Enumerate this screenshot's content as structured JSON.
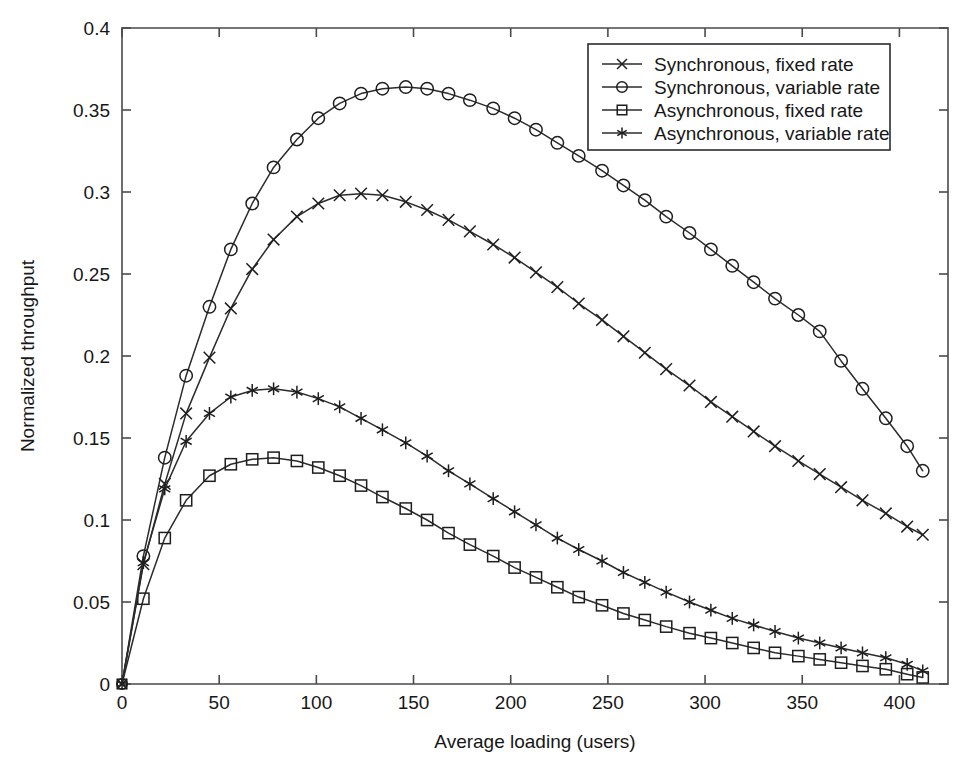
{
  "chart_data": {
    "type": "line",
    "title": "",
    "xlabel": "Average loading (users)",
    "ylabel": "Normalized throughput",
    "xlim": [
      0,
      425
    ],
    "ylim": [
      0,
      0.4
    ],
    "xticks": [
      0,
      50,
      100,
      150,
      200,
      250,
      300,
      350,
      400
    ],
    "xtick_labels": [
      "0",
      "50",
      "100",
      "150",
      "200",
      "250",
      "300",
      "350",
      "400"
    ],
    "yticks": [
      0,
      0.05,
      0.1,
      0.15,
      0.2,
      0.25,
      0.3,
      0.35,
      0.4
    ],
    "ytick_labels": [
      "0",
      "0.05",
      "0.1",
      "0.15",
      "0.2",
      "0.25",
      "0.3",
      "0.35",
      "0.4"
    ],
    "grid": false,
    "legend_position": "top-right",
    "line_color": "#2b2b2b",
    "background_color": "#ffffff",
    "series": [
      {
        "name": "Synchronous, fixed rate",
        "marker": "x",
        "x": [
          0,
          11,
          22,
          33,
          45,
          56,
          67,
          78,
          90,
          101,
          112,
          123,
          134,
          146,
          157,
          168,
          179,
          191,
          202,
          213,
          224,
          235,
          247,
          258,
          269,
          280,
          292,
          303,
          314,
          325,
          336,
          348,
          359,
          370,
          381,
          393,
          404,
          412
        ],
        "values": [
          0.0,
          0.073,
          0.122,
          0.165,
          0.199,
          0.229,
          0.253,
          0.271,
          0.285,
          0.293,
          0.298,
          0.299,
          0.298,
          0.294,
          0.289,
          0.283,
          0.276,
          0.268,
          0.26,
          0.251,
          0.242,
          0.232,
          0.222,
          0.212,
          0.202,
          0.192,
          0.182,
          0.172,
          0.163,
          0.154,
          0.145,
          0.136,
          0.128,
          0.12,
          0.112,
          0.104,
          0.096,
          0.091
        ]
      },
      {
        "name": "Synchronous, variable rate",
        "marker": "o",
        "x": [
          0,
          11,
          22,
          33,
          45,
          56,
          67,
          78,
          90,
          101,
          112,
          123,
          134,
          146,
          157,
          168,
          179,
          191,
          202,
          213,
          224,
          235,
          247,
          258,
          269,
          280,
          292,
          303,
          314,
          325,
          336,
          348,
          359,
          370,
          381,
          393,
          404,
          412
        ],
        "values": [
          0.0,
          0.078,
          0.138,
          0.188,
          0.23,
          0.265,
          0.293,
          0.315,
          0.332,
          0.345,
          0.354,
          0.36,
          0.363,
          0.364,
          0.363,
          0.36,
          0.356,
          0.351,
          0.345,
          0.338,
          0.33,
          0.322,
          0.313,
          0.304,
          0.295,
          0.285,
          0.275,
          0.265,
          0.255,
          0.245,
          0.235,
          0.225,
          0.215,
          0.197,
          0.18,
          0.162,
          0.145,
          0.13
        ]
      },
      {
        "name": "Asynchronous, fixed rate",
        "marker": "s",
        "x": [
          0,
          11,
          22,
          33,
          45,
          56,
          67,
          78,
          90,
          101,
          112,
          123,
          134,
          146,
          157,
          168,
          179,
          191,
          202,
          213,
          224,
          235,
          247,
          258,
          269,
          280,
          292,
          303,
          314,
          325,
          336,
          348,
          359,
          370,
          381,
          393,
          404,
          412
        ],
        "values": [
          0.0,
          0.052,
          0.089,
          0.112,
          0.127,
          0.134,
          0.137,
          0.138,
          0.136,
          0.132,
          0.127,
          0.121,
          0.114,
          0.107,
          0.1,
          0.092,
          0.085,
          0.078,
          0.071,
          0.065,
          0.059,
          0.053,
          0.048,
          0.043,
          0.039,
          0.035,
          0.031,
          0.028,
          0.025,
          0.022,
          0.019,
          0.017,
          0.015,
          0.013,
          0.011,
          0.009,
          0.006,
          0.004
        ]
      },
      {
        "name": "Asynchronous, variable rate",
        "marker": "*",
        "x": [
          0,
          11,
          22,
          33,
          45,
          56,
          67,
          78,
          90,
          101,
          112,
          123,
          134,
          146,
          157,
          168,
          179,
          191,
          202,
          213,
          224,
          235,
          247,
          258,
          269,
          280,
          292,
          303,
          314,
          325,
          336,
          348,
          359,
          370,
          381,
          393,
          404,
          412
        ],
        "values": [
          0.0,
          0.074,
          0.119,
          0.148,
          0.165,
          0.175,
          0.179,
          0.18,
          0.178,
          0.174,
          0.169,
          0.162,
          0.155,
          0.147,
          0.139,
          0.13,
          0.122,
          0.113,
          0.105,
          0.097,
          0.089,
          0.082,
          0.075,
          0.068,
          0.062,
          0.056,
          0.05,
          0.045,
          0.04,
          0.036,
          0.032,
          0.028,
          0.025,
          0.022,
          0.019,
          0.016,
          0.012,
          0.008
        ]
      }
    ]
  }
}
